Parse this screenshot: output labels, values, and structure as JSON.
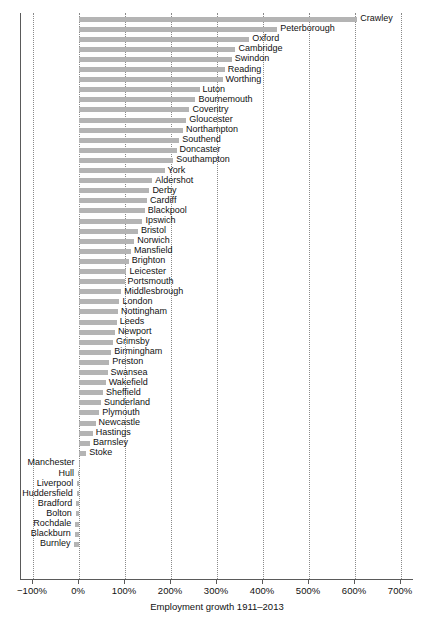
{
  "chart_data": {
    "type": "bar",
    "orientation": "horizontal",
    "title": "",
    "xlabel": "Employment growth 1911–2013",
    "ylabel": "",
    "xlim": [
      -100,
      700
    ],
    "xtick_labels": [
      "−100%",
      "0%",
      "100%",
      "200%",
      "300%",
      "400%",
      "500%",
      "600%",
      "700%"
    ],
    "xticks": [
      -100,
      0,
      100,
      200,
      300,
      400,
      500,
      600,
      700
    ],
    "grid": "vertical-dotted",
    "legend": "none",
    "bar_color": "#b4b4b4",
    "categories": [
      "Crawley",
      "Peterborough",
      "Oxford",
      "Cambridge",
      "Swindon",
      "Reading",
      "Worthing",
      "Luton",
      "Bournemouth",
      "Coventry",
      "Gloucester",
      "Northampton",
      "Southend",
      "Doncaster",
      "Southampton",
      "York",
      "Aldershot",
      "Derby",
      "Cardiff",
      "Blackpool",
      "Ipswich",
      "Bristol",
      "Norwich",
      "Mansfield",
      "Brighton",
      "Leicester",
      "Portsmouth",
      "Middlesbrough",
      "London",
      "Nottingham",
      "Leeds",
      "Newport",
      "Grimsby",
      "Birmingham",
      "Preston",
      "Swansea",
      "Wakefield",
      "Sheffield",
      "Sunderland",
      "Plymouth",
      "Newcastle",
      "Hastings",
      "Barnsley",
      "Stoke",
      "Manchester",
      "Hull",
      "Liverpool",
      "Huddersfield",
      "Bradford",
      "Bolton",
      "Rochdale",
      "Blackburn",
      "Burnley"
    ],
    "values": [
      605,
      431,
      370,
      340,
      332,
      317,
      312,
      262,
      253,
      240,
      233,
      226,
      218,
      212,
      205,
      186,
      159,
      153,
      148,
      143,
      138,
      128,
      120,
      113,
      108,
      103,
      99,
      92,
      88,
      85,
      82,
      78,
      74,
      70,
      66,
      62,
      58,
      52,
      48,
      44,
      36,
      30,
      24,
      16,
      -1,
      -2,
      -4,
      -5,
      -6,
      -7,
      -8,
      -9,
      -10
    ],
    "value_unit": "percent"
  }
}
